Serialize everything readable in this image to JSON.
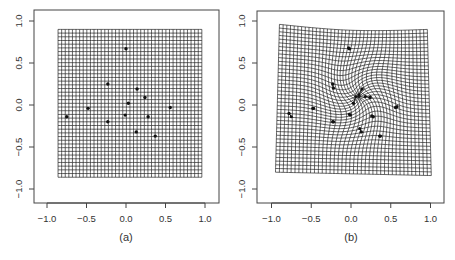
{
  "figure": {
    "panels": [
      {
        "id": "a",
        "caption": "(a)"
      },
      {
        "id": "b",
        "caption": "(b)"
      }
    ]
  },
  "chart_data": [
    {
      "type": "scatter",
      "title": "",
      "caption": "(a)",
      "xlabel": "",
      "ylabel": "",
      "xlim": [
        -1.15,
        1.15
      ],
      "ylim": [
        -1.2,
        1.15
      ],
      "xticks": [
        -1.0,
        -0.5,
        0.0,
        0.5,
        1.0
      ],
      "xtick_labels": [
        "-1.0",
        "-0.5",
        "0.0",
        "0.5",
        "1.0"
      ],
      "yticks": [
        -1.0,
        -0.5,
        0.0,
        0.5,
        1.0
      ],
      "ytick_labels": [
        "-1.0",
        "-0.5",
        "0.0",
        "0.5",
        "1.0"
      ],
      "grid": {
        "style": "regular",
        "x_range": [
          -0.86,
          0.96
        ],
        "y_range": [
          -0.86,
          0.9
        ],
        "cells": 40
      },
      "points": [
        {
          "x": 0.0,
          "y": 0.67
        },
        {
          "x": -0.23,
          "y": 0.25
        },
        {
          "x": 0.14,
          "y": 0.19
        },
        {
          "x": 0.24,
          "y": 0.09
        },
        {
          "x": 0.03,
          "y": 0.02
        },
        {
          "x": -0.48,
          "y": -0.04
        },
        {
          "x": 0.56,
          "y": -0.03
        },
        {
          "x": -0.75,
          "y": -0.14
        },
        {
          "x": -0.01,
          "y": -0.12
        },
        {
          "x": 0.28,
          "y": -0.14
        },
        {
          "x": -0.23,
          "y": -0.2
        },
        {
          "x": 0.13,
          "y": -0.32
        },
        {
          "x": 0.37,
          "y": -0.37
        }
      ]
    },
    {
      "type": "scatter",
      "title": "",
      "caption": "(b)",
      "xlabel": "",
      "ylabel": "",
      "xlim": [
        -1.15,
        1.15
      ],
      "ylim": [
        -1.2,
        1.15
      ],
      "xticks": [
        -1.0,
        -0.5,
        0.0,
        0.5,
        1.0
      ],
      "xtick_labels": [
        "-1.0",
        "-0.5",
        "0.0",
        "0.5",
        "1.0"
      ],
      "yticks": [
        -1.0,
        -0.5,
        0.0,
        0.5,
        1.0
      ],
      "ytick_labels": [
        "-1.0",
        "-0.5",
        "0.0",
        "0.5",
        "1.0"
      ],
      "grid": {
        "style": "warped",
        "cells": 40,
        "corners": {
          "top_left": [
            -0.9,
            0.96
          ],
          "top_right": [
            0.96,
            0.9
          ],
          "bottom_left": [
            -0.95,
            -0.8
          ],
          "bottom_right": [
            1.01,
            -0.84
          ]
        },
        "warp_center": [
          0.1,
          0.1
        ],
        "warp_strength": 0.12,
        "warp_radius": 0.35
      },
      "points": [
        {
          "x": -0.02,
          "y": 0.67,
          "x2": -0.03,
          "y2": 0.68
        },
        {
          "x": -0.23,
          "y": 0.25,
          "x2": -0.22,
          "y2": 0.2
        },
        {
          "x": 0.14,
          "y": 0.19,
          "x2": 0.1,
          "y2": 0.12
        },
        {
          "x": 0.24,
          "y": 0.09,
          "x2": 0.18,
          "y2": 0.1
        },
        {
          "x": 0.03,
          "y": 0.02,
          "x2": 0.06,
          "y2": 0.1
        },
        {
          "x": -0.48,
          "y": -0.04,
          "x2": -0.47,
          "y2": -0.04
        },
        {
          "x": 0.56,
          "y": -0.03,
          "x2": 0.58,
          "y2": -0.02
        },
        {
          "x": -0.78,
          "y": -0.1,
          "x2": -0.75,
          "y2": -0.14
        },
        {
          "x": -0.01,
          "y": -0.12,
          "x2": -0.02,
          "y2": -0.11
        },
        {
          "x": 0.28,
          "y": -0.14,
          "x2": 0.26,
          "y2": -0.13
        },
        {
          "x": -0.23,
          "y": -0.2,
          "x2": -0.22,
          "y2": -0.2
        },
        {
          "x": 0.13,
          "y": -0.32,
          "x2": 0.11,
          "y2": -0.28
        },
        {
          "x": 0.37,
          "y": -0.37,
          "x2": 0.36,
          "y2": -0.37
        }
      ]
    }
  ]
}
